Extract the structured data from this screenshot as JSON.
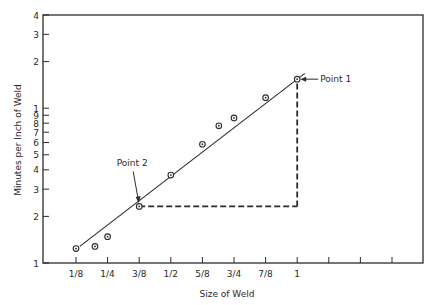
{
  "chart_data": {
    "type": "scatter",
    "title": "",
    "xlabel": "Size of Weld",
    "ylabel": "Minutes per Inch of Weld",
    "x_scale": "linear",
    "y_scale": "log",
    "xlim": [
      0,
      1.375
    ],
    "ylim": [
      1,
      40
    ],
    "x_ticks": [
      {
        "value": 0.125,
        "label": "1/8"
      },
      {
        "value": 0.25,
        "label": "1/4"
      },
      {
        "value": 0.375,
        "label": "3/8"
      },
      {
        "value": 0.5,
        "label": "1/2"
      },
      {
        "value": 0.625,
        "label": "5/8"
      },
      {
        "value": 0.75,
        "label": "3/4"
      },
      {
        "value": 0.875,
        "label": "7/8"
      },
      {
        "value": 1.0,
        "label": "1"
      },
      {
        "value": 1.125,
        "label": ""
      },
      {
        "value": 1.25,
        "label": ""
      },
      {
        "value": 1.375,
        "label": ""
      }
    ],
    "y_ticks": [
      {
        "value": 1,
        "label": "1"
      },
      {
        "value": 2,
        "label": "2"
      },
      {
        "value": 3,
        "label": "3"
      },
      {
        "value": 4,
        "label": "4"
      },
      {
        "value": 5,
        "label": "5"
      },
      {
        "value": 6,
        "label": "6"
      },
      {
        "value": 7,
        "label": "7"
      },
      {
        "value": 8,
        "label": "8"
      },
      {
        "value": 9,
        "label": "9"
      },
      {
        "value": 10,
        "label": "1"
      },
      {
        "value": 20,
        "label": "2"
      },
      {
        "value": 30,
        "label": "3"
      },
      {
        "value": 40,
        "label": "4"
      }
    ],
    "grid": false,
    "legend": null,
    "series": [
      {
        "name": "Observed",
        "marker": "circle-dot",
        "points": [
          {
            "x": 0.125,
            "y": 1.24
          },
          {
            "x": 0.2,
            "y": 1.28
          },
          {
            "x": 0.25,
            "y": 1.48
          },
          {
            "x": 0.375,
            "y": 2.32
          },
          {
            "x": 0.5,
            "y": 3.7
          },
          {
            "x": 0.625,
            "y": 5.85
          },
          {
            "x": 0.69,
            "y": 7.7
          },
          {
            "x": 0.75,
            "y": 8.65
          },
          {
            "x": 0.875,
            "y": 11.7
          },
          {
            "x": 1.0,
            "y": 15.4
          }
        ]
      }
    ],
    "fit_line": {
      "from": {
        "x": 0.14,
        "y": 1.28
      },
      "to": {
        "x": 1.03,
        "y": 16.8
      }
    },
    "annotations": [
      {
        "label": "Point 1",
        "x": 1.0,
        "y": 15.4
      },
      {
        "label": "Point 2",
        "x": 0.375,
        "y": 2.32
      }
    ],
    "dashed_guides": [
      {
        "from": {
          "x": 0.375,
          "y": 2.32
        },
        "to": {
          "x": 1.0,
          "y": 2.32
        }
      },
      {
        "from": {
          "x": 1.0,
          "y": 2.32
        },
        "to": {
          "x": 1.0,
          "y": 15.4
        }
      }
    ]
  }
}
